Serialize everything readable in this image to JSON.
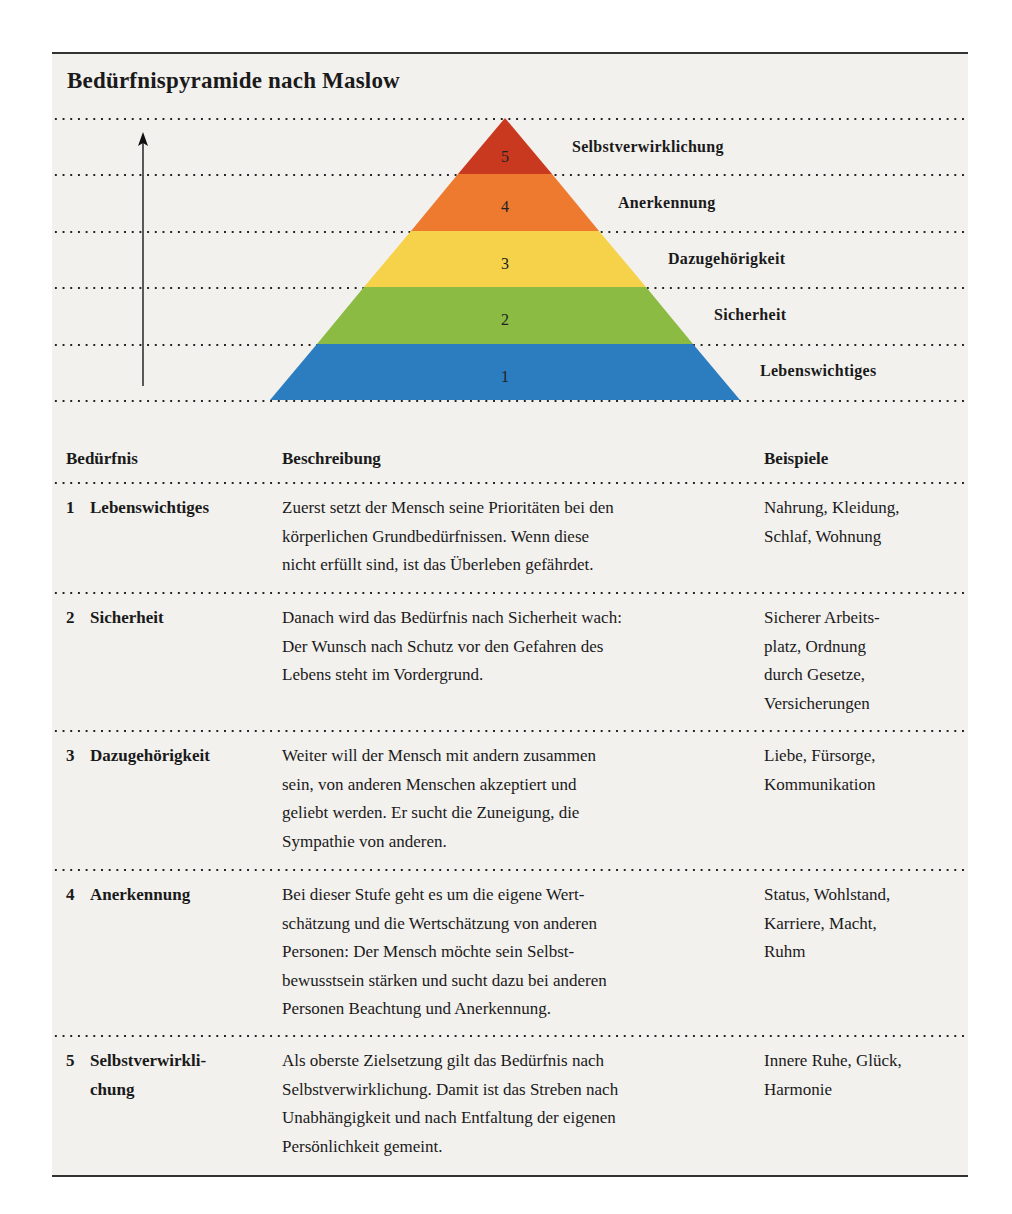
{
  "title": "Bedürfnispyramide nach Maslow",
  "pyramid": {
    "levels": [
      {
        "number": "5",
        "label": "Selbstverwirklichung",
        "color": "#c8391f"
      },
      {
        "number": "4",
        "label": "Anerkennung",
        "color": "#ee7a30"
      },
      {
        "number": "3",
        "label": "Dazugehörigkeit",
        "color": "#f6d24a"
      },
      {
        "number": "2",
        "label": "Sicherheit",
        "color": "#8bbb43"
      },
      {
        "number": "1",
        "label": "Lebenswichtiges",
        "color": "#2c7cc0"
      }
    ],
    "arrow_icon": "up-arrow-icon"
  },
  "table": {
    "headers": [
      "Bedürfnis",
      "Beschreibung",
      "Beispiele"
    ],
    "rows": [
      {
        "number": "1",
        "name_lines": [
          "Lebenswichtiges"
        ],
        "description_lines": [
          "Zuerst setzt der Mensch seine Prioritäten bei den",
          "körperlichen Grundbedürfnissen. Wenn diese",
          "nicht erfüllt sind, ist das Überleben gefährdet."
        ],
        "examples_lines": [
          "Nahrung, Kleidung,",
          "Schlaf, Wohnung"
        ]
      },
      {
        "number": "2",
        "name_lines": [
          "Sicherheit"
        ],
        "description_lines": [
          "Danach wird das Bedürfnis nach Sicherheit wach:",
          "Der Wunsch nach Schutz vor den Gefahren des",
          "Lebens steht im Vordergrund."
        ],
        "examples_lines": [
          "Sicherer Arbeits-",
          "platz, Ordnung",
          "durch Gesetze,",
          "Versicherungen"
        ]
      },
      {
        "number": "3",
        "name_lines": [
          "Dazugehörigkeit"
        ],
        "description_lines": [
          "Weiter will der Mensch mit andern zusammen",
          "sein, von anderen Menschen akzeptiert und",
          "geliebt werden. Er sucht die Zuneigung, die",
          "Sympathie von anderen."
        ],
        "examples_lines": [
          "Liebe, Fürsorge,",
          "Kommunikation"
        ]
      },
      {
        "number": "4",
        "name_lines": [
          "Anerkennung"
        ],
        "description_lines": [
          "Bei dieser Stufe geht es um die eigene Wert-",
          "schätzung und die Wertschätzung von anderen",
          "Personen: Der Mensch möchte sein Selbst-",
          "bewusstsein stärken und sucht dazu bei anderen",
          "Personen Beachtung und Anerkennung."
        ],
        "examples_lines": [
          "Status, Wohlstand,",
          "Karriere, Macht,",
          "Ruhm"
        ]
      },
      {
        "number": "5",
        "name_lines": [
          "Selbstverwirkli-",
          "chung"
        ],
        "description_lines": [
          "Als oberste Zielsetzung gilt das Bedürfnis nach",
          "Selbstverwirklichung. Damit ist das Streben nach",
          "Unabhängigkeit und nach Entfaltung der eigenen",
          "Persönlichkeit gemeint."
        ],
        "examples_lines": [
          "Innere Ruhe, Glück,",
          "Harmonie"
        ]
      }
    ]
  }
}
